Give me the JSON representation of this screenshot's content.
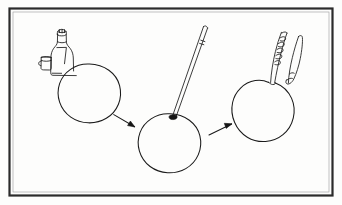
{
  "figure": {
    "caption": "Line drawing: bottle and cup beside a sphere, a rod inserted into the sphere, then hands working at the sphere's opening.",
    "background_color": "#fdfdfc",
    "ink_color": "#1a1a1a",
    "frame_color": "#2b2b2b",
    "width": 342,
    "height": 205
  },
  "frame": {
    "name": "picture-border",
    "style": "rectangular dark border with thin inner rule"
  },
  "panels": [
    {
      "index": 1,
      "name": "panel-materials",
      "label": "Step 1",
      "description": "Bottle of liquid with small open cup standing beside a large plain sphere",
      "objects": [
        {
          "name": "liquid-bottle",
          "shape": "narrow-neck bottle with cap",
          "detail": "label outline drawn on body"
        },
        {
          "name": "bottle-cap",
          "shape": "ridged screw cap"
        },
        {
          "name": "small-cup",
          "shape": "short cylindrical cup with rim"
        },
        {
          "name": "sphere-plain",
          "shape": "circle",
          "state": "undeformed"
        }
      ]
    },
    {
      "index": 2,
      "name": "panel-rod-insertion",
      "label": "Step 2",
      "description": "Long thin rod or skewer inserted through the top of the sphere",
      "objects": [
        {
          "name": "insertion-rod",
          "shape": "long tapering rod",
          "detail": "small collar mark near upper end"
        },
        {
          "name": "insertion-point",
          "shape": "filled dark opening at sphere top"
        },
        {
          "name": "sphere-pierced",
          "shape": "circle",
          "state": "rod inserted at top"
        }
      ]
    },
    {
      "index": 3,
      "name": "panel-hand-work",
      "label": "Step 3",
      "description": "Two hands or twisted tools working at the dimpled top of the sphere",
      "objects": [
        {
          "name": "twisted-tool",
          "shape": "spiral twisted strand"
        },
        {
          "name": "pointing-finger",
          "shape": "curved pointed finger"
        },
        {
          "name": "sphere-dimpled",
          "shape": "circle with notched top",
          "state": "opening pinched at top"
        }
      ]
    }
  ],
  "arrows": [
    {
      "name": "arrow-step1-to-step2",
      "direction": "down-right",
      "from_panel": 1,
      "to_panel": 2
    },
    {
      "name": "arrow-step2-to-step3",
      "direction": "up-right",
      "from_panel": 2,
      "to_panel": 3
    }
  ]
}
